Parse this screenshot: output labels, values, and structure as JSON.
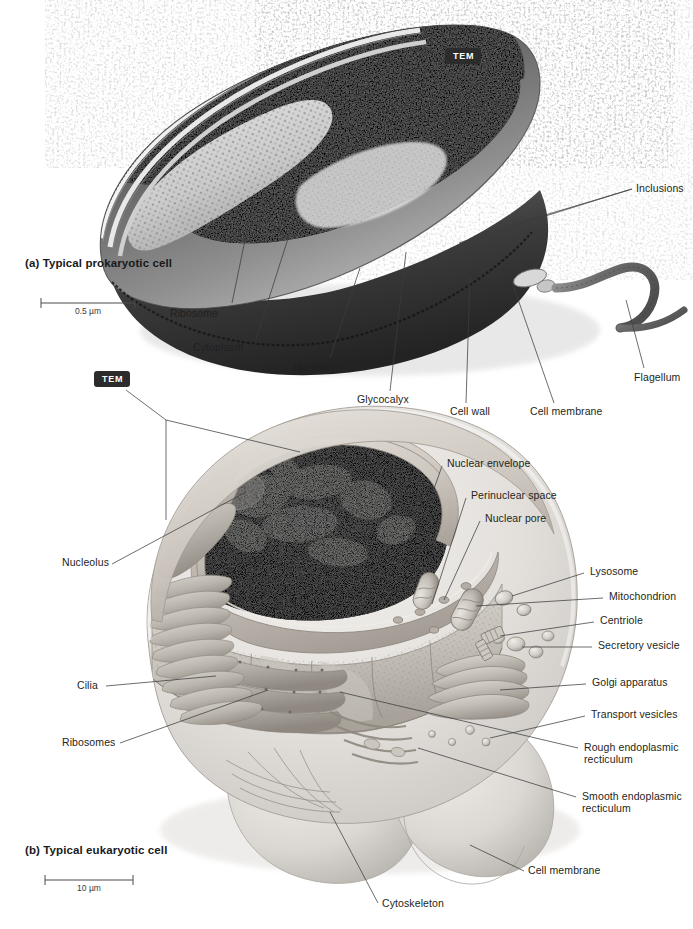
{
  "figure": {
    "type": "biology-textbook-figure",
    "background_color": "#ffffff",
    "label_color": "#231f20",
    "leader_line_color": "#3c3c3c",
    "badge_background": "#2c2c2c",
    "badge_text_color": "#ffffff"
  },
  "panels": [
    {
      "id": "panel-a",
      "caption": "(a) Typical prokaryotic cell",
      "micrograph_badge": "TEM",
      "scale_bar": {
        "value": "0.5 µm"
      }
    },
    {
      "id": "panel-b",
      "caption": "(b) Typical eukaryotic cell",
      "micrograph_badge": "TEM",
      "scale_bar": {
        "value": "10 µm"
      }
    }
  ],
  "prokaryote_labels": {
    "inclusions": "Inclusions",
    "ribosome": "Ribosome",
    "cytoplasm": "Cytoplasm",
    "nucleoid": "Nucleoid",
    "glycocalyx": "Glycocalyx",
    "cell_wall": "Cell wall",
    "cell_membrane": "Cell membrane",
    "flagellum": "Flagellum"
  },
  "eukaryote_labels": {
    "nuclear_envelope": "Nuclear envelope",
    "perinuclear_space": "Perinuclear space",
    "nuclear_pore": "Nuclear pore",
    "nucleolus": "Nucleolus",
    "lysosome": "Lysosome",
    "mitochondrion": "Mitochondrion",
    "centriole": "Centriole",
    "secretory_vesicle": "Secretory vesicle",
    "golgi_apparatus": "Golgi apparatus",
    "transport_vesicles": "Transport vesicles",
    "rough_er": "Rough endoplasmic\nrecticulum",
    "smooth_er": "Smooth endoplasmic\nrecticulum",
    "cilia": "Cilia",
    "ribosomes": "Ribosomes",
    "cytoskeleton": "Cytoskeleton",
    "cell_membrane": "Cell membrane"
  }
}
